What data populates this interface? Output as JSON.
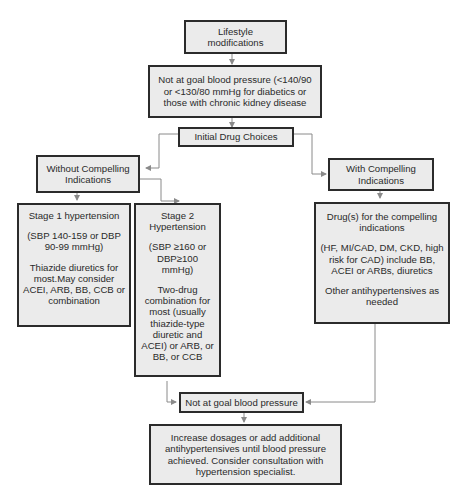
{
  "diagram": {
    "nodes": {
      "lifestyle": {
        "text": "Lifestyle modifications"
      },
      "not_goal_1": {
        "text": "Not at goal blood pressure (<140/90 or <130/80 mmHg for diabetics or those with chronic kidney disease"
      },
      "initial": {
        "text": "Initial Drug Choices"
      },
      "without": {
        "line1": "Without Compelling",
        "line2": "Indications"
      },
      "with": {
        "line1": "With Compelling",
        "line2": "Indications"
      },
      "stage1": {
        "title": "Stage 1 hypertension",
        "range": "(SBP 140-159 or DBP 90-99 mmHg)",
        "therapy": "Thiazide diuretics for most.May consider ACEI, ARB, BB, CCB or combination"
      },
      "stage2": {
        "title": "Stage 2 Hypertension",
        "range": "(SBP ≥160 or DBP≥100 mmHg)",
        "therapy": "Two-drug combination for most (usually thiazide-type diuretic and ACEI) or ARB, or BB, or CCB"
      },
      "compelling_drugs": {
        "title": "Drug(s) for the compelling indications",
        "detail": "(HF, MI/CAD, DM, CKD, high risk for CAD) include BB, ACEI or ARBs, diuretics",
        "other": "Other antihypertensives as needed"
      },
      "not_goal_2": {
        "text": "Not at goal blood pressure"
      },
      "increase": {
        "text": "Increase dosages or add additional antihypertensives until blood pressure achieved. Consider consultation with hypertension specialist."
      }
    },
    "edges": [
      {
        "from": "lifestyle",
        "to": "not_goal_1"
      },
      {
        "from": "not_goal_1",
        "to": "initial"
      },
      {
        "from": "initial",
        "to": "without"
      },
      {
        "from": "initial",
        "to": "with"
      },
      {
        "from": "without",
        "to": "stage1"
      },
      {
        "from": "without",
        "to": "stage2"
      },
      {
        "from": "with",
        "to": "compelling_drugs"
      },
      {
        "from": "stage2",
        "to": "not_goal_2"
      },
      {
        "from": "compelling_drugs",
        "to": "not_goal_2"
      },
      {
        "from": "not_goal_2",
        "to": "increase"
      }
    ],
    "colors": {
      "box_fill": "#ebebeb",
      "box_border": "#2b2b2b",
      "connector": "#8a8a8a"
    }
  }
}
